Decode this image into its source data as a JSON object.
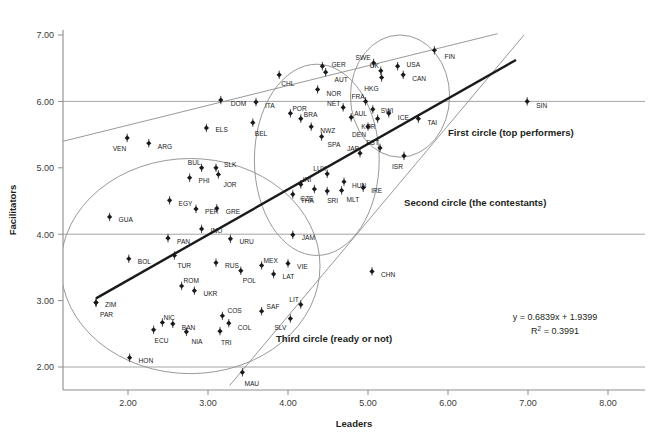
{
  "chart_data": {
    "type": "scatter",
    "title": "",
    "xlabel": "Leaders",
    "ylabel": "Facilitators",
    "xlim": [
      1.19,
      8.1
    ],
    "ylim": [
      1.7,
      7.25
    ],
    "xticks": [
      "2.00",
      "3.00",
      "4.00",
      "5.00",
      "6.00",
      "7.00",
      "8.00"
    ],
    "xtick_values": [
      2,
      3,
      4,
      5,
      6,
      7,
      8
    ],
    "yticks": [
      "2.00",
      "3.00",
      "4.00",
      "5.00",
      "6.00",
      "7.00"
    ],
    "ytick_values": [
      2,
      3,
      4,
      5,
      6,
      7
    ],
    "grid": "horizontal-only",
    "gridlines_y": [
      2,
      4,
      6
    ],
    "legend_position": "none",
    "trendline": {
      "equation": "y = 0.6839x + 1.9399",
      "r_squared": "R",
      "r_squared_sup": "2",
      "r_squared_value": "= 0.3991",
      "slope": 0.6839,
      "intercept": 1.9399,
      "x_start": 1.6,
      "x_end": 6.85,
      "color": "#1a1a1a"
    },
    "annotations": [
      {
        "text": "First circle (top performers)",
        "x": 6.0,
        "y": 5.48
      },
      {
        "text": "Second circle (the contestants)",
        "x": 5.45,
        "y": 4.43
      },
      {
        "text": "Third circle (ready or not)",
        "x": 3.85,
        "y": 2.37
      }
    ],
    "ellipses": [
      {
        "name": "third-circle-ellipse",
        "cx": 2.78,
        "cy": 3.52,
        "rx": 1.62,
        "ry": 1.62,
        "rotate": 0,
        "color": "#8d8d8d"
      },
      {
        "name": "second-circle-ellipse",
        "cx": 4.36,
        "cy": 5.12,
        "rx": 0.78,
        "ry": 1.44,
        "rotate": 0,
        "color": "#8d8d8d"
      },
      {
        "name": "first-circle-ellipse",
        "cx": 5.4,
        "cy": 6.08,
        "rx": 0.62,
        "ry": 0.92,
        "rotate": 0,
        "color": "#8d8d8d"
      }
    ],
    "cone_lines": [
      {
        "name": "cone-upper-line",
        "x1": 1.19,
        "y1": 5.4,
        "x2": 6.62,
        "y2": 7.02,
        "color": "#8d8d8d"
      },
      {
        "name": "cone-lower-line",
        "x1": 3.27,
        "y1": 1.72,
        "x2": 6.95,
        "y2": 7.0,
        "color": "#8d8d8d"
      }
    ],
    "points": [
      {
        "label": "FIN",
        "x": 5.83,
        "y": 6.77,
        "lx": 10,
        "ly": 6
      },
      {
        "label": "SWE",
        "x": 5.07,
        "y": 6.58,
        "lx": -3,
        "ly": -5
      },
      {
        "label": "USA",
        "x": 5.37,
        "y": 6.53,
        "lx": 9,
        "ly": -2
      },
      {
        "label": "UK",
        "x": 5.16,
        "y": 6.46,
        "lx": -2,
        "ly": -5
      },
      {
        "label": "CAN",
        "x": 5.44,
        "y": 6.4,
        "lx": 9,
        "ly": 4
      },
      {
        "label": "HKG",
        "x": 5.17,
        "y": 6.36,
        "lx": -3,
        "ly": 11
      },
      {
        "label": "GER",
        "x": 4.43,
        "y": 6.53,
        "lx": 9,
        "ly": -2
      },
      {
        "label": "AUT",
        "x": 4.47,
        "y": 6.44,
        "lx": 9,
        "ly": 7
      },
      {
        "label": "CHL",
        "x": 3.89,
        "y": 6.4,
        "lx": 2,
        "ly": 9
      },
      {
        "label": "NOR",
        "x": 4.37,
        "y": 6.18,
        "lx": 9,
        "ly": 4
      },
      {
        "label": "DOM",
        "x": 3.16,
        "y": 6.02,
        "lx": 10,
        "ly": 4
      },
      {
        "label": "ITA",
        "x": 3.6,
        "y": 5.99,
        "lx": 9,
        "ly": 4
      },
      {
        "label": "SIN",
        "x": 6.99,
        "y": 6.0,
        "lx": 9,
        "ly": 4
      },
      {
        "label": "FRA",
        "x": 4.97,
        "y": 6.0,
        "lx": -1,
        "ly": -5
      },
      {
        "label": "NET",
        "x": 4.69,
        "y": 5.91,
        "lx": -3,
        "ly": -4
      },
      {
        "label": "SWI",
        "x": 5.06,
        "y": 5.88,
        "lx": 8,
        "ly": 1
      },
      {
        "label": "ICE",
        "x": 5.26,
        "y": 5.82,
        "lx": 9,
        "ly": 4
      },
      {
        "label": "POR",
        "x": 4.03,
        "y": 5.82,
        "lx": 2,
        "ly": -5
      },
      {
        "label": "BRA",
        "x": 4.16,
        "y": 5.74,
        "lx": 3,
        "ly": -4
      },
      {
        "label": "AUL",
        "x": 4.79,
        "y": 5.76,
        "lx": 3,
        "ly": -4
      },
      {
        "label": "KOR",
        "x": 5.12,
        "y": 5.74,
        "lx": -2,
        "ly": 8
      },
      {
        "label": "BEL",
        "x": 3.56,
        "y": 5.68,
        "lx": 2,
        "ly": 11
      },
      {
        "label": "NWZ",
        "x": 4.29,
        "y": 5.62,
        "lx": 9,
        "ly": 4
      },
      {
        "label": "DEN",
        "x": 5.0,
        "y": 5.62,
        "lx": -2,
        "ly": 8
      },
      {
        "label": "TAI",
        "x": 5.63,
        "y": 5.74,
        "lx": 9,
        "ly": 4
      },
      {
        "label": "SPA",
        "x": 4.42,
        "y": 5.47,
        "lx": 6,
        "ly": 8
      },
      {
        "label": "ELS",
        "x": 2.98,
        "y": 5.6,
        "lx": 9,
        "ly": 2
      },
      {
        "label": "VEN",
        "x": 1.99,
        "y": 5.45,
        "lx": -1,
        "ly": 11
      },
      {
        "label": "ARG",
        "x": 2.26,
        "y": 5.37,
        "lx": 9,
        "ly": 3
      },
      {
        "label": "EST",
        "x": 5.15,
        "y": 5.3,
        "lx": -1,
        "ly": -5
      },
      {
        "label": "JAP",
        "x": 4.9,
        "y": 5.22,
        "lx": -1,
        "ly": -5
      },
      {
        "label": "ISR",
        "x": 5.45,
        "y": 5.18,
        "lx": -1,
        "ly": 11
      },
      {
        "label": "BUL",
        "x": 2.92,
        "y": 5.0,
        "lx": -1,
        "ly": -5
      },
      {
        "label": "SLK",
        "x": 3.1,
        "y": 5.0,
        "lx": 8,
        "ly": -3
      },
      {
        "label": "JOR",
        "x": 3.13,
        "y": 4.9,
        "lx": 5,
        "ly": 10
      },
      {
        "label": "LUX",
        "x": 4.49,
        "y": 4.91,
        "lx": -1,
        "ly": -5
      },
      {
        "label": "HUN",
        "x": 4.7,
        "y": 4.79,
        "lx": 8,
        "ly": 4
      },
      {
        "label": "PHI",
        "x": 2.77,
        "y": 4.85,
        "lx": 9,
        "ly": 3
      },
      {
        "label": "INI",
        "x": 4.16,
        "y": 4.75,
        "lx": 2,
        "ly": -5
      },
      {
        "label": "CZE",
        "x": 4.33,
        "y": 4.68,
        "lx": -1,
        "ly": 10
      },
      {
        "label": "SRI",
        "x": 4.49,
        "y": 4.65,
        "lx": 0,
        "ly": 10
      },
      {
        "label": "MLT",
        "x": 4.67,
        "y": 4.66,
        "lx": 5,
        "ly": 9
      },
      {
        "label": "IRE",
        "x": 4.94,
        "y": 4.7,
        "lx": 8,
        "ly": 3
      },
      {
        "label": "THA",
        "x": 4.06,
        "y": 4.6,
        "lx": 8,
        "ly": 6
      },
      {
        "label": "EGY",
        "x": 2.52,
        "y": 4.51,
        "lx": 9,
        "ly": 3
      },
      {
        "label": "PER",
        "x": 2.85,
        "y": 4.38,
        "lx": 9,
        "ly": 3
      },
      {
        "label": "GRE",
        "x": 3.11,
        "y": 4.39,
        "lx": 9,
        "ly": 3
      },
      {
        "label": "GUA",
        "x": 1.77,
        "y": 4.26,
        "lx": 9,
        "ly": 3
      },
      {
        "label": "INO",
        "x": 2.92,
        "y": 4.08,
        "lx": 9,
        "ly": 2
      },
      {
        "label": "JAM",
        "x": 4.06,
        "y": 3.99,
        "lx": 9,
        "ly": 3
      },
      {
        "label": "PAN",
        "x": 2.5,
        "y": 3.94,
        "lx": 9,
        "ly": 3
      },
      {
        "label": "URU",
        "x": 3.28,
        "y": 3.93,
        "lx": 9,
        "ly": 3
      },
      {
        "label": "TUR",
        "x": 2.58,
        "y": 3.68,
        "lx": 3,
        "ly": 10
      },
      {
        "label": "BOL",
        "x": 2.01,
        "y": 3.63,
        "lx": 9,
        "ly": 3
      },
      {
        "label": "RUS",
        "x": 3.1,
        "y": 3.57,
        "lx": 9,
        "ly": 3
      },
      {
        "label": "MEX",
        "x": 3.67,
        "y": 3.53,
        "lx": 2,
        "ly": -5
      },
      {
        "label": "VIE",
        "x": 4.0,
        "y": 3.56,
        "lx": 9,
        "ly": 3
      },
      {
        "label": "POL",
        "x": 3.41,
        "y": 3.45,
        "lx": 2,
        "ly": 10
      },
      {
        "label": "LAT",
        "x": 3.82,
        "y": 3.4,
        "lx": 9,
        "ly": 3
      },
      {
        "label": "CHN",
        "x": 5.05,
        "y": 3.44,
        "lx": 9,
        "ly": 3
      },
      {
        "label": "ROM",
        "x": 2.67,
        "y": 3.22,
        "lx": 2,
        "ly": -5
      },
      {
        "label": "UKR",
        "x": 2.83,
        "y": 3.15,
        "lx": 9,
        "ly": 3
      },
      {
        "label": "ZIM",
        "x": 1.6,
        "y": 2.97,
        "lx": 9,
        "ly": 2
      },
      {
        "label": "PAR",
        "x": 1.6,
        "y": 2.97,
        "lx": 4,
        "ly": 12
      },
      {
        "label": "LIT",
        "x": 4.16,
        "y": 2.94,
        "lx": -2,
        "ly": -5
      },
      {
        "label": "SAF",
        "x": 3.67,
        "y": 2.84,
        "lx": 5,
        "ly": -5
      },
      {
        "label": "COS",
        "x": 3.18,
        "y": 2.77,
        "lx": 5,
        "ly": -5
      },
      {
        "label": "SLV",
        "x": 4.03,
        "y": 2.73,
        "lx": -4,
        "ly": 9
      },
      {
        "label": "NIC",
        "x": 2.43,
        "y": 2.67,
        "lx": 1,
        "ly": -5
      },
      {
        "label": "BAN",
        "x": 2.56,
        "y": 2.65,
        "lx": 9,
        "ly": 4
      },
      {
        "label": "COL",
        "x": 3.26,
        "y": 2.66,
        "lx": 9,
        "ly": 4
      },
      {
        "label": "ECU",
        "x": 2.32,
        "y": 2.56,
        "lx": 1,
        "ly": 11
      },
      {
        "label": "NIA",
        "x": 2.73,
        "y": 2.53,
        "lx": 5,
        "ly": 10
      },
      {
        "label": "TRI",
        "x": 3.15,
        "y": 2.54,
        "lx": 1,
        "ly": 11
      },
      {
        "label": "HON",
        "x": 2.02,
        "y": 2.14,
        "lx": 9,
        "ly": 3
      },
      {
        "label": "MAU",
        "x": 3.43,
        "y": 1.92,
        "lx": 2,
        "ly": 11
      }
    ],
    "colors": {
      "point": "#1a1a1a",
      "gridline": "#9a9a9a",
      "axis": "#8d8d8d",
      "trend": "#1a1a1a",
      "ellipse": "#8d8d8d",
      "text": "#231f20"
    }
  }
}
